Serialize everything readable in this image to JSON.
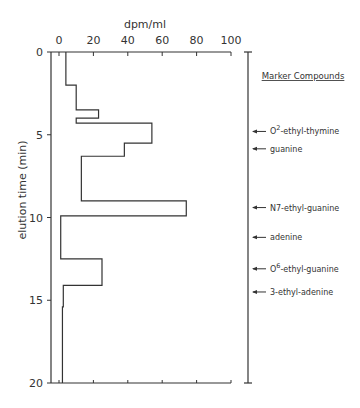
{
  "chart_data": {
    "type": "line",
    "subtype": "step-histogram",
    "orientation": "vertical (time on y axis, increasing downward)",
    "title": "",
    "xlabel": "dpm/ml",
    "ylabel": "elution time (min)",
    "xlim": [
      0,
      100
    ],
    "ylim": [
      0,
      20
    ],
    "xticks": [
      0,
      20,
      40,
      60,
      80,
      100
    ],
    "yticks": [
      0,
      5,
      10,
      15,
      20
    ],
    "grid": false,
    "series": [
      {
        "name": "radioactivity",
        "steps": [
          {
            "t_start": 0.0,
            "t_end": 2.0,
            "value": 4
          },
          {
            "t_start": 2.0,
            "t_end": 3.5,
            "value": 10
          },
          {
            "t_start": 3.5,
            "t_end": 4.0,
            "value": 23
          },
          {
            "t_start": 4.0,
            "t_end": 4.3,
            "value": 10
          },
          {
            "t_start": 4.3,
            "t_end": 5.5,
            "value": 54
          },
          {
            "t_start": 5.5,
            "t_end": 6.3,
            "value": 38
          },
          {
            "t_start": 6.3,
            "t_end": 9.0,
            "value": 13
          },
          {
            "t_start": 9.0,
            "t_end": 9.9,
            "value": 74
          },
          {
            "t_start": 9.9,
            "t_end": 12.5,
            "value": 1
          },
          {
            "t_start": 12.5,
            "t_end": 14.1,
            "value": 25
          },
          {
            "t_start": 14.1,
            "t_end": 15.4,
            "value": 2.5
          },
          {
            "t_start": 15.4,
            "t_end": 20.0,
            "value": 2
          }
        ]
      }
    ],
    "markers": {
      "title": "Marker Compounds",
      "items": [
        {
          "label": "O2-ethyl-thymine",
          "base": "O",
          "sup": "2",
          "rest": "-ethyl-thymine",
          "time": 4.8
        },
        {
          "label": "guanine",
          "base": "guanine",
          "sup": "",
          "rest": "",
          "time": 5.85
        },
        {
          "label": "N7-ethyl-guanine",
          "base": "N7-ethyl-guanine",
          "sup": "",
          "rest": "",
          "time": 9.4
        },
        {
          "label": "adenine",
          "base": "adenine",
          "sup": "",
          "rest": "",
          "time": 11.2
        },
        {
          "label": "O6-ethyl-guanine",
          "base": "O",
          "sup": "6",
          "rest": "-ethyl-guanine",
          "time": 13.1
        },
        {
          "label": "3-ethyl-adenine",
          "base": "3-ethyl-adenine",
          "sup": "",
          "rest": "",
          "time": 14.5
        }
      ]
    }
  },
  "colors": {
    "line": "#333333",
    "axis": "#333333",
    "text": "#333333"
  }
}
